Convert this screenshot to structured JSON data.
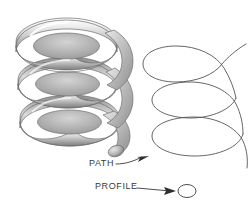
{
  "figure": {
    "background_color": "#ffffff",
    "line_color": "#3a3a3a",
    "solid_light": "#f2f2f2",
    "solid_mid": "#c9c9c9",
    "solid_dark": "#8d8d8d",
    "solid_shadow": "#6e6e6e"
  },
  "labels": {
    "path": "PATH",
    "profile": "PROFILE"
  },
  "annotations": [
    {
      "name": "path-leader",
      "label": "PATH",
      "target": "helix-curve",
      "arrow_tip": [
        148,
        157
      ]
    },
    {
      "name": "profile-leader",
      "label": "PROFILE",
      "target": "profile-ellipse",
      "arrow_tip": [
        175,
        191
      ]
    }
  ],
  "geometry": {
    "solid_coil": {
      "name": "shaded-helical-solid",
      "turns": 3,
      "bounds": [
        14,
        16,
        124,
        148
      ],
      "tube_thickness": 17
    },
    "wire_helix": {
      "name": "wireframe-helix-path",
      "turns": 3,
      "bounds": [
        142,
        46,
        246,
        168
      ],
      "loop_rx": 41,
      "loop_ry": 15,
      "pitch": 40
    },
    "profile_ellipse": {
      "name": "profile-circle",
      "center": [
        187,
        191
      ],
      "rx": 9,
      "ry": 6.5
    }
  }
}
